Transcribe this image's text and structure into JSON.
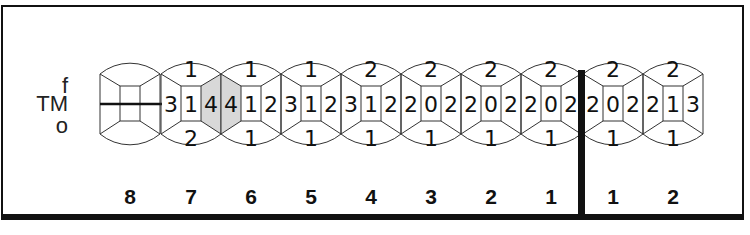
{
  "row_labels": {
    "top": "f",
    "middle": "TM",
    "bottom": "o"
  },
  "colors": {
    "line": "#333333",
    "shade": "#d8d8d8",
    "frame": "#111111"
  },
  "teeth": [
    {
      "number": "8",
      "cx": 130,
      "missing": true,
      "top": "",
      "left": "",
      "center": "",
      "right": "",
      "bottom": ""
    },
    {
      "number": "7",
      "cx": 191,
      "missing": false,
      "top": "1",
      "left": "3",
      "center": "1",
      "right": "4",
      "bottom": "2",
      "shade_right": true
    },
    {
      "number": "6",
      "cx": 251,
      "missing": false,
      "top": "1",
      "left": "4",
      "center": "1",
      "right": "2",
      "bottom": "1",
      "shade_left": true
    },
    {
      "number": "5",
      "cx": 311,
      "missing": false,
      "top": "1",
      "left": "3",
      "center": "1",
      "right": "2",
      "bottom": "1"
    },
    {
      "number": "4",
      "cx": 371,
      "missing": false,
      "top": "2",
      "left": "3",
      "center": "1",
      "right": "2",
      "bottom": "1"
    },
    {
      "number": "3",
      "cx": 431,
      "missing": false,
      "top": "2",
      "left": "2",
      "center": "0",
      "right": "2",
      "bottom": "1"
    },
    {
      "number": "2",
      "cx": 491,
      "missing": false,
      "top": "2",
      "left": "2",
      "center": "0",
      "right": "2",
      "bottom": "1"
    },
    {
      "number": "1",
      "cx": 551,
      "missing": false,
      "top": "2",
      "left": "2",
      "center": "0",
      "right": "2",
      "bottom": "1"
    },
    {
      "number": "1",
      "cx": 613,
      "missing": false,
      "top": "2",
      "left": "2",
      "center": "0",
      "right": "2",
      "bottom": "1"
    },
    {
      "number": "2",
      "cx": 673,
      "missing": false,
      "top": "2",
      "left": "2",
      "center": "1",
      "right": "3",
      "bottom": "1"
    }
  ],
  "midline_x": 581
}
